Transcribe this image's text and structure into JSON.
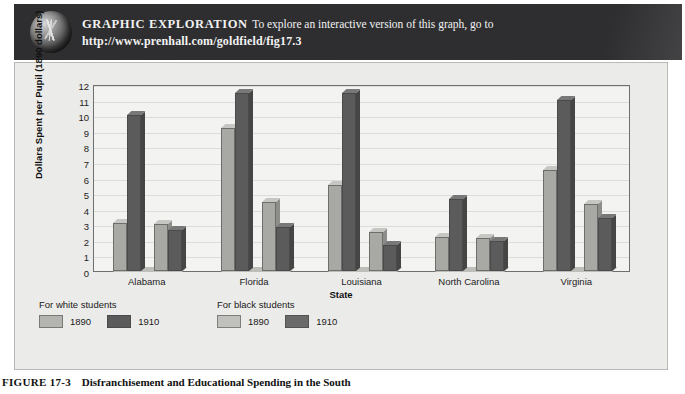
{
  "banner": {
    "label": "GRAPHIC  EXPLORATION",
    "body": "To explore an interactive version of this graph, go to",
    "url": "http://www.prenhall.com/goldfield/fig17.3",
    "globe_icon": "globe-icon"
  },
  "caption": {
    "number": "FIGURE 17-3",
    "text": "Disfranchisement and Educational Spending in the South"
  },
  "legend": {
    "groups": [
      {
        "title": "For white students",
        "items": [
          {
            "label": "1890",
            "swatch": "light"
          },
          {
            "label": "1910",
            "swatch": "dark"
          }
        ]
      },
      {
        "title": "For black students",
        "items": [
          {
            "label": "1890",
            "swatch": "light"
          },
          {
            "label": "1910",
            "swatch": "dark"
          }
        ]
      }
    ]
  },
  "chart_data": {
    "type": "bar",
    "title": "",
    "xlabel": "State",
    "ylabel": "Dollars Spent per Pupil (1890 dollars)",
    "categories": [
      "Alabama",
      "Florida",
      "Louisiana",
      "North Carolina",
      "Virginia"
    ],
    "yticks": [
      12,
      11,
      10,
      9,
      8,
      7,
      6,
      5,
      4,
      3,
      2,
      1,
      0
    ],
    "ylim": [
      0,
      12
    ],
    "grid": true,
    "legend_position": "below-plot-left",
    "series": [
      {
        "name": "For white students 1890",
        "color": "#a8a8a4",
        "values": [
          3.1,
          9.2,
          5.5,
          2.2,
          6.5
        ]
      },
      {
        "name": "For white students 1910",
        "color": "#5b5b5b",
        "values": [
          10.0,
          11.4,
          11.4,
          4.6,
          11.0
        ]
      },
      {
        "name": "For black students 1890",
        "color": "#a8a8a4",
        "values": [
          3.0,
          4.4,
          2.5,
          2.1,
          4.3
        ]
      },
      {
        "name": "For black students 1910",
        "color": "#5b5b5b",
        "values": [
          2.6,
          2.8,
          1.7,
          1.9,
          3.4
        ]
      }
    ]
  }
}
